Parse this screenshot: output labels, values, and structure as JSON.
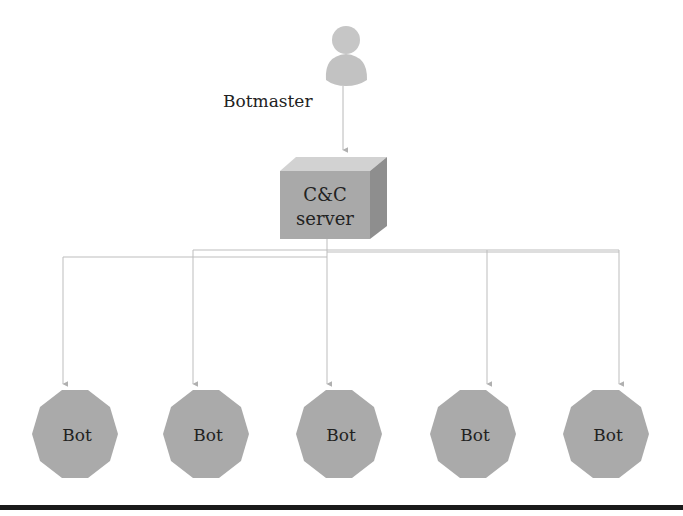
{
  "diagram": {
    "botmaster": {
      "label": "Botmaster",
      "icon": "person-icon",
      "color": "#c4c4c4"
    },
    "server": {
      "line1": "C&C",
      "line2": "server",
      "front_color": "#a9a9a9",
      "top_color": "#d2d2d2",
      "side_color": "#8e8e8e"
    },
    "bots": [
      {
        "label": "Bot"
      },
      {
        "label": "Bot"
      },
      {
        "label": "Bot"
      },
      {
        "label": "Bot"
      },
      {
        "label": "Bot"
      }
    ],
    "colors": {
      "bot_fill": "#aaaaaa",
      "connector": "#b8b8b8",
      "text": "#222222",
      "rule": "#1a1a1a"
    }
  }
}
